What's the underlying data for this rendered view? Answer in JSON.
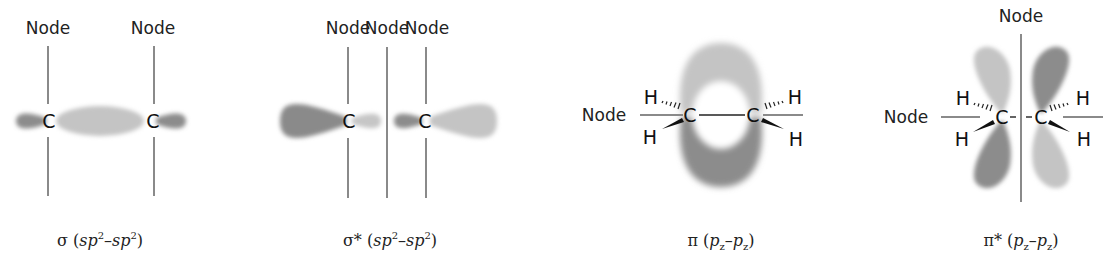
{
  "colors": {
    "dark_lobe": "#8c8c8c",
    "light_lobe": "#c4c4c4",
    "node_line": "#8a8a8a",
    "text": "#222222",
    "background": "#ffffff"
  },
  "diagrams": [
    {
      "id": "sigma",
      "node_labels": [
        "Node",
        "Node"
      ],
      "atoms": [
        "C",
        "C"
      ],
      "caption": {
        "symbol": "σ",
        "open": " (",
        "a": "sp",
        "a_sup": "2",
        "dash": "–",
        "b": "sp",
        "b_sup": "2",
        "close": ")"
      }
    },
    {
      "id": "sigma-star",
      "node_labels": [
        "Node",
        "Node",
        "Node"
      ],
      "atoms": [
        "C",
        "C"
      ],
      "caption": {
        "symbol": "σ*",
        "open": " (",
        "a": "sp",
        "a_sup": "2",
        "dash": "–",
        "b": "sp",
        "b_sup": "2",
        "close": ")"
      }
    },
    {
      "id": "pi",
      "node_labels": [
        "Node"
      ],
      "atoms": [
        "C",
        "C"
      ],
      "hydrogens": [
        "H",
        "H",
        "H",
        "H"
      ],
      "caption": {
        "symbol": "π",
        "open": " (",
        "a": "p",
        "a_sub": "z",
        "dash": "–",
        "b": "p",
        "b_sub": "z",
        "close": ")"
      }
    },
    {
      "id": "pi-star",
      "node_labels": [
        "Node",
        "Node"
      ],
      "atoms": [
        "C",
        "C"
      ],
      "hydrogens": [
        "H",
        "H",
        "H",
        "H"
      ],
      "caption": {
        "symbol": "π*",
        "open": " (",
        "a": "p",
        "a_sub": "z",
        "dash": "–",
        "b": "p",
        "b_sub": "z",
        "close": ")"
      }
    }
  ]
}
